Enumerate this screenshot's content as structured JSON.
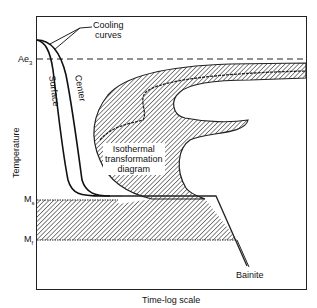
{
  "diagram": {
    "type": "TTT diagram with cooling curves",
    "axes": {
      "x_label": "Time-log scale",
      "y_label": "Temperature"
    },
    "temperature_marks": {
      "ae3": "Ae",
      "ae3_sub": "3",
      "ms": "M",
      "ms_sub": "s",
      "mf": "M",
      "mf_sub": "f"
    },
    "labels": {
      "cooling_line1": "Cooling",
      "cooling_line2": "curves",
      "surface": "Surface",
      "center": "Center",
      "iso_line1": "Isothermal",
      "iso_line2": "transformation",
      "iso_line3": "diagram",
      "bainite": "Bainite"
    },
    "colors": {
      "line": "#111111",
      "background": "#ffffff"
    }
  }
}
